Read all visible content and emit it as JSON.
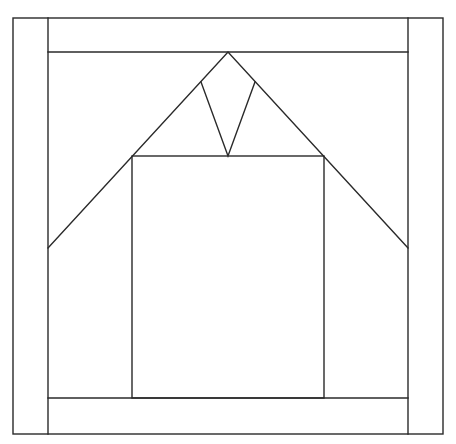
{
  "diagram": {
    "type": "quilt-block-line-drawing",
    "background": "#ffffff",
    "stroke_color": "#2a2a2a",
    "stroke_width": 1.4,
    "outer_frame": {
      "x1": 13,
      "y1": 18,
      "x2": 443,
      "y2": 434
    },
    "left_border_strip": {
      "x1": 13,
      "y1": 18,
      "x2": 48,
      "y2": 434
    },
    "right_border_strip": {
      "x1": 408,
      "y1": 18,
      "x2": 443,
      "y2": 434
    },
    "top_border_strip": {
      "x1": 48,
      "y1": 18,
      "x2": 408,
      "y2": 52
    },
    "bottom_border_strip": {
      "x1": 48,
      "y1": 398,
      "x2": 408,
      "y2": 434
    },
    "roof_triangle": {
      "apex": [
        228,
        52
      ],
      "left_end": [
        48,
        248
      ],
      "right_end": [
        408,
        248
      ]
    },
    "center_square": {
      "x1": 132,
      "y1": 156,
      "x2": 324,
      "y2": 398
    },
    "v_shape": {
      "left_top": [
        201,
        82
      ],
      "bottom": [
        228,
        156
      ],
      "right_top": [
        255,
        82
      ]
    }
  }
}
